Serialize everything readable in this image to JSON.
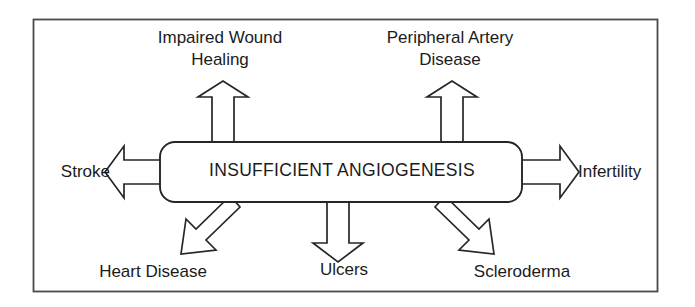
{
  "figure": {
    "type": "radial-concept-diagram",
    "frame": {
      "border_color": "#4a4a4a",
      "background": "#ffffff"
    },
    "center_node": {
      "label": "INSUFFICIENT ANGIOGENESIS",
      "shape": "rounded-rectangle",
      "stroke_color": "#262626",
      "fill_color": "#ffffff"
    },
    "arrow_style": {
      "stroke_color": "#262626",
      "fill_color": "#ffffff",
      "outline": "hollow-block-arrow"
    },
    "outcomes": [
      {
        "id": "impaired-wound-healing",
        "label": "Impaired Wound\nHealing",
        "label_line_1": "Impaired Wound",
        "label_line_2": "Healing",
        "direction": "up",
        "position": "top-left"
      },
      {
        "id": "peripheral-artery-disease",
        "label": "Peripheral Artery\nDisease",
        "label_line_1": "Peripheral Artery",
        "label_line_2": "Disease",
        "direction": "up",
        "position": "top-right"
      },
      {
        "id": "stroke",
        "label": "Stroke",
        "direction": "left",
        "position": "left"
      },
      {
        "id": "infertility",
        "label": "Infertility",
        "direction": "right",
        "position": "right"
      },
      {
        "id": "heart-disease",
        "label": "Heart Disease",
        "direction": "down-left",
        "position": "bottom-left"
      },
      {
        "id": "ulcers",
        "label": "Ulcers",
        "direction": "down",
        "position": "bottom-center"
      },
      {
        "id": "scleroderma",
        "label": "Scleroderma",
        "direction": "down-right",
        "position": "bottom-right"
      }
    ]
  }
}
